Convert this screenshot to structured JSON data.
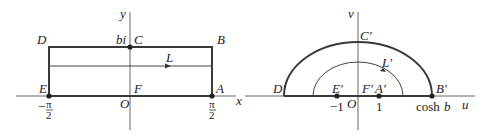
{
  "left_panel": {
    "axes": {
      "x": "x",
      "y": "y",
      "origin": "O"
    },
    "points": {
      "A": "A",
      "B": "B",
      "C": "C",
      "D": "D",
      "E": "E",
      "F": "F"
    },
    "labels": {
      "bi": "bi",
      "L": "L"
    },
    "ticks": {
      "neg_sign": "−",
      "pi": "π",
      "two": "2"
    }
  },
  "right_panel": {
    "axes": {
      "u": "u",
      "v": "v",
      "origin": "O"
    },
    "points": {
      "A": "A′",
      "B": "B′",
      "C": "C′",
      "D": "D′",
      "E": "E′",
      "F": "F′"
    },
    "labels": {
      "L": "L′"
    },
    "ticks": {
      "minus_one": "−1",
      "one": "1",
      "cosh": "cosh",
      "b": "b"
    }
  },
  "colors": {
    "stroke": "#3a3a3a",
    "axis": "#555555"
  }
}
